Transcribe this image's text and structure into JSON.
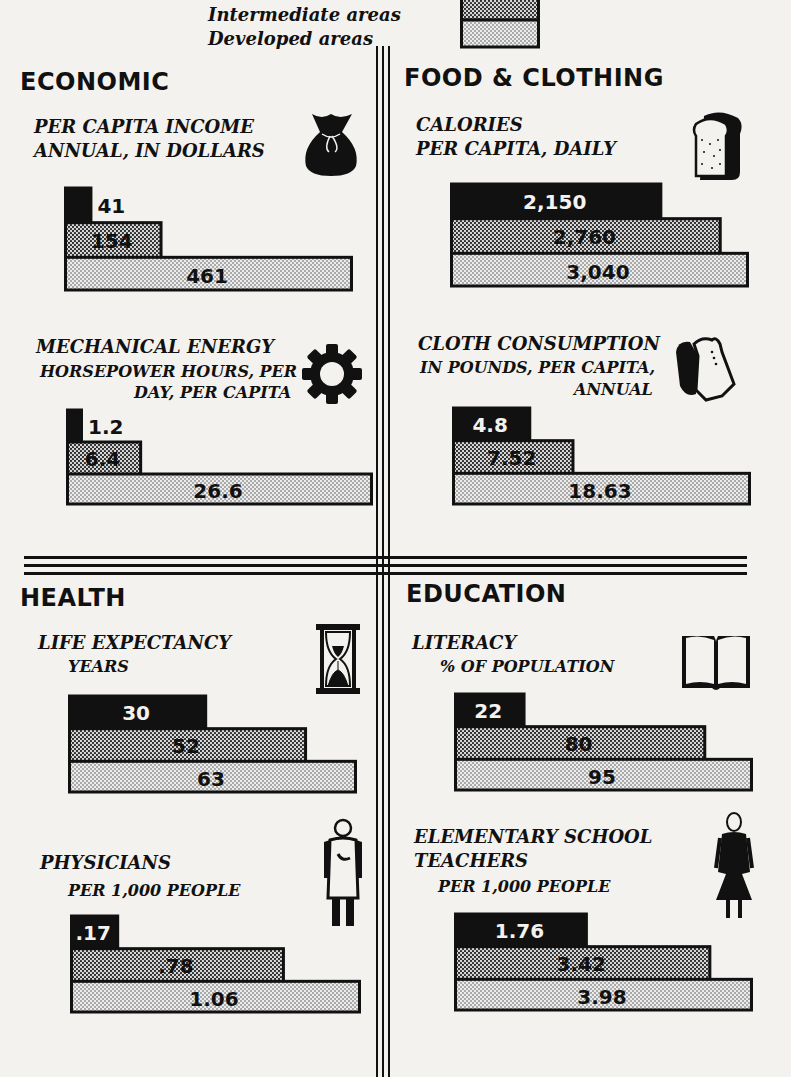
{
  "legend": {
    "items": [
      {
        "label": "Intermediate areas",
        "pattern": "dots-dense"
      },
      {
        "label": "Developed areas",
        "pattern": "dots-light"
      }
    ]
  },
  "sections": {
    "economic": {
      "title": "ECONOMIC"
    },
    "food_clothing": {
      "title": "FOOD & CLOTHING"
    },
    "health": {
      "title": "HEALTH"
    },
    "education": {
      "title": "EDUCATION"
    }
  },
  "colors": {
    "underdeveloped": "#111111",
    "intermediate": "#8a8a8a",
    "developed": "#d4d4d4",
    "ink": "#111111",
    "paper": "#f4f2ee"
  },
  "chart_data": [
    {
      "type": "bar",
      "id": "income",
      "section": "ECONOMIC",
      "title": "PER CAPITA INCOME",
      "subtitle": "ANNUAL, IN DOLLARS",
      "icon": "money-bag-icon",
      "categories": [
        "Underdeveloped areas",
        "Intermediate areas",
        "Developed areas"
      ],
      "values": [
        41,
        154,
        461
      ],
      "labels": [
        "41",
        "154",
        "461"
      ]
    },
    {
      "type": "bar",
      "id": "calories",
      "section": "FOOD & CLOTHING",
      "title": "CALORIES",
      "subtitle": "PER CAPITA, DAILY",
      "icon": "bread-icon",
      "categories": [
        "Underdeveloped areas",
        "Intermediate areas",
        "Developed areas"
      ],
      "values": [
        2150,
        2760,
        3040
      ],
      "labels": [
        "2,150",
        "2,760",
        "3,040"
      ]
    },
    {
      "type": "bar",
      "id": "energy",
      "section": "ECONOMIC",
      "title": "MECHANICAL ENERGY",
      "subtitle": "HORSEPOWER HOURS, PER",
      "subtitle2": "DAY, PER CAPITA",
      "icon": "gear-icon",
      "categories": [
        "Underdeveloped areas",
        "Intermediate areas",
        "Developed areas"
      ],
      "values": [
        1.2,
        6.4,
        26.6
      ],
      "labels": [
        "1.2",
        "6.4",
        "26.6"
      ]
    },
    {
      "type": "bar",
      "id": "cloth",
      "section": "FOOD & CLOTHING",
      "title": "CLOTH CONSUMPTION",
      "subtitle": "IN POUNDS, PER CAPITA,",
      "subtitle2": "ANNUAL",
      "icon": "clothing-icon",
      "categories": [
        "Underdeveloped areas",
        "Intermediate areas",
        "Developed areas"
      ],
      "values": [
        4.8,
        7.52,
        18.63
      ],
      "labels": [
        "4.8",
        "7.52",
        "18.63"
      ]
    },
    {
      "type": "bar",
      "id": "life",
      "section": "HEALTH",
      "title": "LIFE EXPECTANCY",
      "subtitle": "YEARS",
      "icon": "hourglass-icon",
      "categories": [
        "Underdeveloped areas",
        "Intermediate areas",
        "Developed areas"
      ],
      "values": [
        30,
        52,
        63
      ],
      "labels": [
        "30",
        "52",
        "63"
      ]
    },
    {
      "type": "bar",
      "id": "literacy",
      "section": "EDUCATION",
      "title": "LITERACY",
      "subtitle": "% OF POPULATION",
      "icon": "book-icon",
      "categories": [
        "Underdeveloped areas",
        "Intermediate areas",
        "Developed areas"
      ],
      "values": [
        22,
        80,
        95
      ],
      "labels": [
        "22",
        "80",
        "95"
      ]
    },
    {
      "type": "bar",
      "id": "physicians",
      "section": "HEALTH",
      "title": "PHYSICIANS",
      "subtitle": "PER 1,000 PEOPLE",
      "icon": "physician-icon",
      "categories": [
        "Underdeveloped areas",
        "Intermediate areas",
        "Developed areas"
      ],
      "values": [
        0.17,
        0.78,
        1.06
      ],
      "labels": [
        ".17",
        ".78",
        "1.06"
      ]
    },
    {
      "type": "bar",
      "id": "teachers",
      "section": "EDUCATION",
      "title": "ELEMENTARY SCHOOL",
      "title2": "TEACHERS",
      "subtitle": "PER 1,000 PEOPLE",
      "icon": "teacher-icon",
      "categories": [
        "Underdeveloped areas",
        "Intermediate areas",
        "Developed areas"
      ],
      "values": [
        1.76,
        3.42,
        3.98
      ],
      "labels": [
        "1.76",
        "3.42",
        "3.98"
      ]
    }
  ]
}
